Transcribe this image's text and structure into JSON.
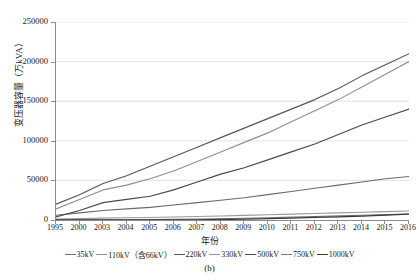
{
  "figure": {
    "caption": "(b)"
  },
  "axes": {
    "ylabel": "变压器容量（万kVA）",
    "xlabel": "年份",
    "yticks": [
      "0",
      "50000",
      "100000",
      "150000",
      "200000",
      "250000"
    ],
    "xticks": [
      "1995",
      "2000",
      "2003",
      "2004",
      "2005",
      "2006",
      "2007",
      "2008",
      "2009",
      "2010",
      "2011",
      "2012",
      "2013",
      "2014",
      "2015",
      "2016"
    ]
  },
  "legend": {
    "items": [
      {
        "label": "35kV",
        "color": "#6b6b6b",
        "width": 1.1
      },
      {
        "label": "110kV（含66kV）",
        "color": "#8f8f8f",
        "width": 1.1
      },
      {
        "label": "220kV",
        "color": "#555555",
        "width": 1.1
      },
      {
        "label": "330kV",
        "color": "#9a9a9a",
        "width": 1.1
      },
      {
        "label": "500kV",
        "color": "#4a4a4a",
        "width": 1.2
      },
      {
        "label": "750kV",
        "color": "#7a7a7a",
        "width": 1.1
      },
      {
        "label": "1000kV",
        "color": "#3a3a3a",
        "width": 1.3
      }
    ]
  },
  "chart_data": {
    "type": "line",
    "title": "",
    "subtitle": "(b)",
    "xlabel": "年份",
    "ylabel": "变压器容量（万kVA）",
    "ylim": [
      0,
      250000
    ],
    "ytick_step": 50000,
    "grid": "horizontal",
    "legend_position": "bottom",
    "x": [
      "1995",
      "2000",
      "2003",
      "2004",
      "2005",
      "2006",
      "2007",
      "2008",
      "2009",
      "2010",
      "2011",
      "2012",
      "2013",
      "2014",
      "2015",
      "2016"
    ],
    "series": [
      {
        "name": "35kV",
        "color": "#6b6b6b",
        "values": [
          6000,
          9000,
          12000,
          14000,
          16000,
          19000,
          22000,
          25000,
          28000,
          32000,
          36000,
          40000,
          44000,
          48000,
          52000,
          55000
        ]
      },
      {
        "name": "110kV（含66kV）",
        "color": "#8f8f8f",
        "values": [
          14000,
          26000,
          38000,
          44000,
          52000,
          62000,
          74000,
          86000,
          98000,
          110000,
          124000,
          138000,
          152000,
          168000,
          184000,
          200000
        ]
      },
      {
        "name": "220kV",
        "color": "#555555",
        "values": [
          20000,
          32000,
          46000,
          56000,
          68000,
          80000,
          92000,
          104000,
          116000,
          128000,
          140000,
          152000,
          166000,
          182000,
          196000,
          210000
        ]
      },
      {
        "name": "330kV",
        "color": "#9a9a9a",
        "values": [
          1200,
          1800,
          2400,
          2800,
          3200,
          3800,
          4400,
          5000,
          5800,
          6600,
          7400,
          8200,
          9000,
          9800,
          10600,
          11400
        ]
      },
      {
        "name": "500kV",
        "color": "#4a4a4a",
        "values": [
          4000,
          12000,
          22000,
          26000,
          30000,
          38000,
          48000,
          58000,
          66000,
          76000,
          86000,
          96000,
          108000,
          120000,
          130000,
          140000
        ]
      },
      {
        "name": "750kV",
        "color": "#7a7a7a",
        "values": [
          0,
          0,
          0,
          0,
          600,
          900,
          1200,
          1600,
          2200,
          2800,
          3600,
          4400,
          5200,
          6000,
          6800,
          7600
        ]
      },
      {
        "name": "1000kV",
        "color": "#3a3a3a",
        "values": [
          0,
          0,
          0,
          0,
          0,
          0,
          0,
          600,
          1200,
          1800,
          2400,
          3200,
          4000,
          5000,
          6200,
          7400
        ]
      }
    ]
  }
}
